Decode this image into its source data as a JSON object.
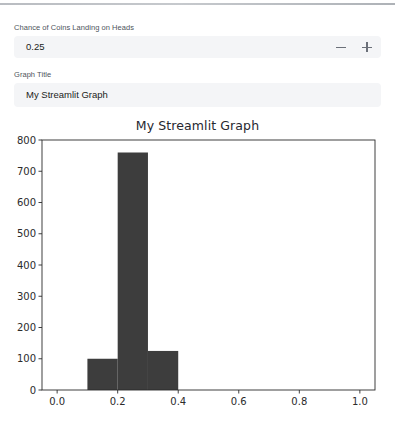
{
  "app": {
    "background": "#ffffff",
    "top_bar_color": "#b9bcc1"
  },
  "controls": [
    {
      "name": "heads-chance",
      "label": "Chance of Coins Landing on Heads",
      "type": "number-input",
      "value": "0.25",
      "decrement_icon": "minus-icon",
      "increment_icon": "plus-icon"
    },
    {
      "name": "graph-title",
      "label": "Graph Title",
      "type": "text-input",
      "value": "My Streamlit Graph"
    }
  ],
  "chart_data": {
    "type": "bar",
    "title": "My Streamlit Graph",
    "xlabel": "",
    "ylabel": "",
    "xlim": [
      -0.05,
      1.05
    ],
    "ylim": [
      0,
      800
    ],
    "grid": false,
    "legend": null,
    "bar_color": "#3d3d3d",
    "axis_color": "#2b2b2b",
    "xticks": [
      "0.0",
      "0.2",
      "0.4",
      "0.6",
      "0.8",
      "1.0"
    ],
    "xtick_values": [
      0.0,
      0.2,
      0.4,
      0.6,
      0.8,
      1.0
    ],
    "yticks": [
      "0",
      "100",
      "200",
      "300",
      "400",
      "500",
      "600",
      "700",
      "800"
    ],
    "ytick_values": [
      0,
      100,
      200,
      300,
      400,
      500,
      600,
      700,
      800
    ],
    "bins": [
      {
        "x0": 0.1,
        "x1": 0.2,
        "value": 100
      },
      {
        "x0": 0.2,
        "x1": 0.3,
        "value": 760
      },
      {
        "x0": 0.3,
        "x1": 0.4,
        "value": 125
      }
    ]
  }
}
